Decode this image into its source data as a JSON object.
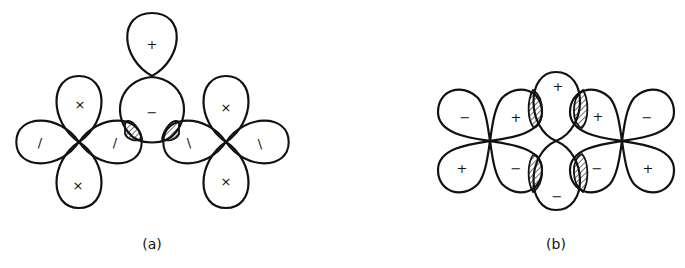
{
  "figure": {
    "panels": [
      {
        "id": "a",
        "caption": "(a)",
        "signs": {
          "top_lobe": "+",
          "central_lobe": "−",
          "left_cross_top": "×",
          "left_cross_bottom": "×",
          "left_cross_left": "/",
          "left_cross_right": "/",
          "right_cross_top": "×",
          "right_cross_bottom": "×",
          "right_cross_left": "\\",
          "right_cross_right": "\\"
        }
      },
      {
        "id": "b",
        "caption": "(b)",
        "signs": {
          "center_top": "+",
          "center_bottom": "−",
          "left_outer_top": "−",
          "left_outer_bottom": "+",
          "left_inner_top": "+",
          "left_inner_bottom": "−",
          "right_inner_top": "+",
          "right_inner_bottom": "−",
          "right_outer_top": "−",
          "right_outer_bottom": "+"
        }
      }
    ]
  },
  "colors": {
    "stroke": "#111111",
    "background": "#ffffff"
  }
}
